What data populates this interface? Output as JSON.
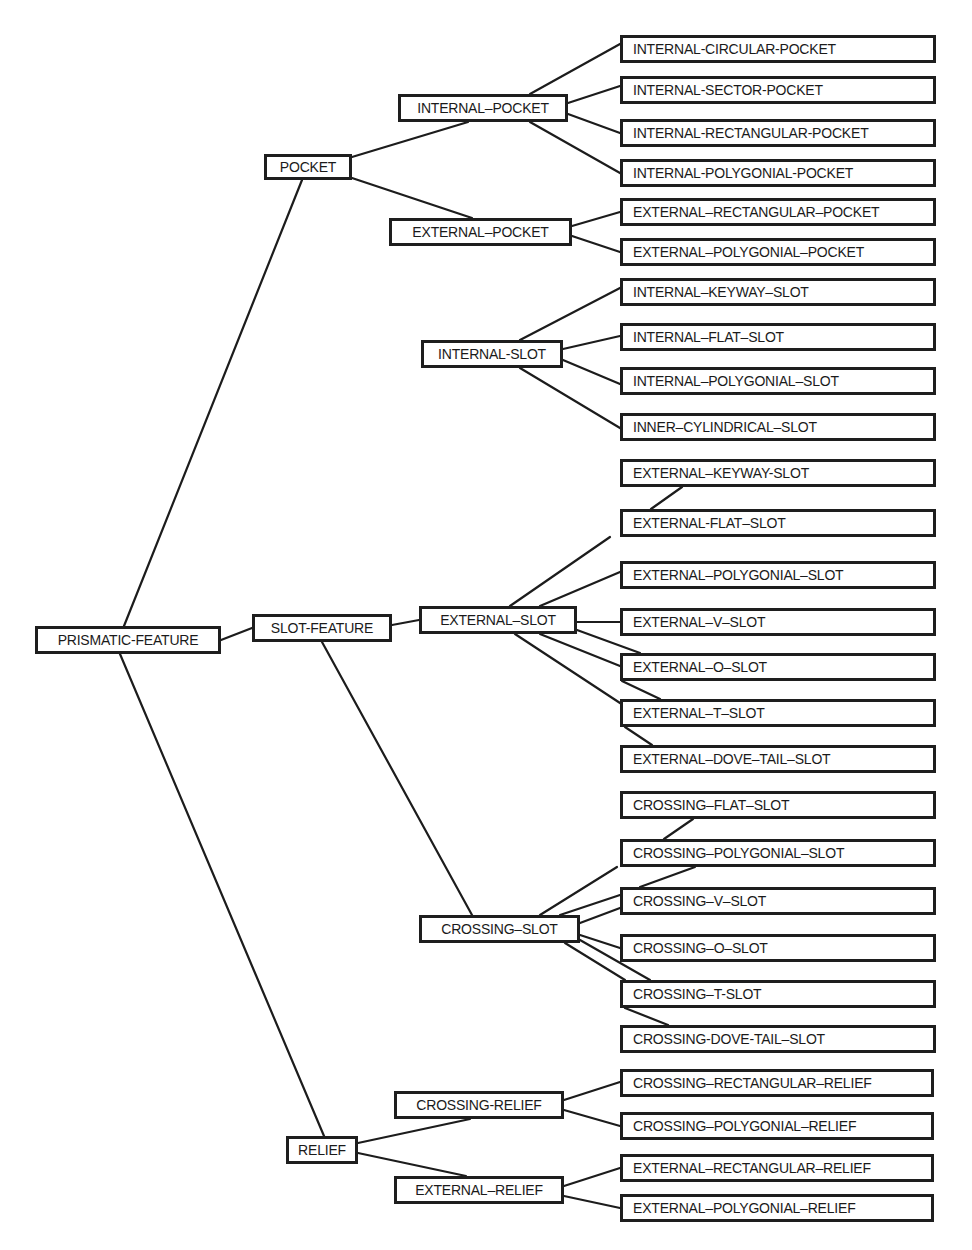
{
  "diagram": {
    "type": "tree",
    "root": "PRISMATIC-FEATURE",
    "nodes": [
      {
        "id": "prismatic-feature",
        "label": "PRISMATIC-FEATURE",
        "x": 35,
        "y": 626,
        "w": 186,
        "h": 28,
        "center": true
      },
      {
        "id": "pocket",
        "label": "POCKET",
        "x": 264,
        "y": 154,
        "w": 88,
        "h": 26,
        "center": true
      },
      {
        "id": "slot-feature",
        "label": "SLOT-FEATURE",
        "x": 252,
        "y": 614,
        "w": 140,
        "h": 28,
        "center": true
      },
      {
        "id": "relief",
        "label": "RELIEF",
        "x": 286,
        "y": 1136,
        "w": 72,
        "h": 28,
        "center": true
      },
      {
        "id": "internal-pocket",
        "label": "INTERNAL–POCKET",
        "x": 398,
        "y": 94,
        "w": 170,
        "h": 28,
        "center": true
      },
      {
        "id": "external-pocket",
        "label": "EXTERNAL–POCKET",
        "x": 389,
        "y": 218,
        "w": 183,
        "h": 28,
        "center": true
      },
      {
        "id": "internal-slot",
        "label": "INTERNAL-SLOT",
        "x": 421,
        "y": 340,
        "w": 142,
        "h": 28,
        "center": true
      },
      {
        "id": "external-slot",
        "label": "EXTERNAL–SLOT",
        "x": 419,
        "y": 606,
        "w": 158,
        "h": 28,
        "center": true
      },
      {
        "id": "crossing-slot",
        "label": "CROSSING–SLOT",
        "x": 419,
        "y": 915,
        "w": 161,
        "h": 28,
        "center": true
      },
      {
        "id": "crossing-relief",
        "label": "CROSSING-RELIEF",
        "x": 394,
        "y": 1091,
        "w": 170,
        "h": 28,
        "center": true
      },
      {
        "id": "external-relief",
        "label": "EXTERNAL–RELIEF",
        "x": 394,
        "y": 1176,
        "w": 170,
        "h": 28,
        "center": true
      },
      {
        "id": "internal-circular-pocket",
        "label": "INTERNAL-CIRCULAR-POCKET",
        "x": 620,
        "y": 35,
        "w": 316,
        "h": 28
      },
      {
        "id": "internal-sector-pocket",
        "label": "INTERNAL-SECTOR-POCKET",
        "x": 620,
        "y": 76,
        "w": 316,
        "h": 28
      },
      {
        "id": "internal-rectangular-pocket",
        "label": "INTERNAL-RECTANGULAR-POCKET",
        "x": 620,
        "y": 119,
        "w": 316,
        "h": 28
      },
      {
        "id": "internal-polygonial-pocket",
        "label": "INTERNAL-POLYGONIAL-POCKET",
        "x": 620,
        "y": 159,
        "w": 316,
        "h": 28
      },
      {
        "id": "external-rectangular-pocket",
        "label": "EXTERNAL–RECTANGULAR–POCKET",
        "x": 620,
        "y": 198,
        "w": 316,
        "h": 28
      },
      {
        "id": "external-polygonial-pocket",
        "label": "EXTERNAL–POLYGONIAL–POCKET",
        "x": 620,
        "y": 238,
        "w": 316,
        "h": 28
      },
      {
        "id": "internal-keyway-slot",
        "label": "INTERNAL–KEYWAY–SLOT",
        "x": 620,
        "y": 278,
        "w": 316,
        "h": 28
      },
      {
        "id": "internal-flat-slot",
        "label": "INTERNAL–FLAT–SLOT",
        "x": 620,
        "y": 323,
        "w": 316,
        "h": 28
      },
      {
        "id": "internal-polygonial-slot",
        "label": "INTERNAL–POLYGONIAL–SLOT",
        "x": 620,
        "y": 367,
        "w": 316,
        "h": 28
      },
      {
        "id": "inner-cylindrical-slot",
        "label": "INNER–CYLINDRICAL–SLOT",
        "x": 620,
        "y": 413,
        "w": 316,
        "h": 28
      },
      {
        "id": "external-keyway-slot",
        "label": "EXTERNAL–KEYWAY-SLOT",
        "x": 620,
        "y": 459,
        "w": 316,
        "h": 28
      },
      {
        "id": "external-flat-slot",
        "label": "EXTERNAL-FLAT–SLOT",
        "x": 620,
        "y": 509,
        "w": 316,
        "h": 28
      },
      {
        "id": "external-polygonial-slot",
        "label": "EXTERNAL–POLYGONIAL–SLOT",
        "x": 620,
        "y": 561,
        "w": 316,
        "h": 28
      },
      {
        "id": "external-v-slot",
        "label": "EXTERNAL–V–SLOT",
        "x": 620,
        "y": 608,
        "w": 316,
        "h": 28
      },
      {
        "id": "external-o-slot",
        "label": "EXTERNAL–O–SLOT",
        "x": 620,
        "y": 653,
        "w": 316,
        "h": 28
      },
      {
        "id": "external-t-slot",
        "label": "EXTERNAL–T–SLOT",
        "x": 620,
        "y": 699,
        "w": 316,
        "h": 28
      },
      {
        "id": "external-dove-tail-slot",
        "label": "EXTERNAL–DOVE–TAIL–SLOT",
        "x": 620,
        "y": 745,
        "w": 316,
        "h": 28
      },
      {
        "id": "crossing-flat-slot",
        "label": "CROSSING–FLAT–SLOT",
        "x": 620,
        "y": 791,
        "w": 316,
        "h": 28
      },
      {
        "id": "crossing-polygonial-slot",
        "label": "CROSSING–POLYGONIAL–SLOT",
        "x": 620,
        "y": 839,
        "w": 316,
        "h": 28
      },
      {
        "id": "crossing-v-slot",
        "label": "CROSSING–V–SLOT",
        "x": 620,
        "y": 887,
        "w": 316,
        "h": 28
      },
      {
        "id": "crossing-o-slot",
        "label": "CROSSING–O–SLOT",
        "x": 620,
        "y": 934,
        "w": 316,
        "h": 28
      },
      {
        "id": "crossing-t-slot",
        "label": "CROSSING–T-SLOT",
        "x": 620,
        "y": 980,
        "w": 316,
        "h": 28
      },
      {
        "id": "crossing-dove-tail-slot",
        "label": "CROSSING-DOVE-TAIL–SLOT",
        "x": 620,
        "y": 1025,
        "w": 316,
        "h": 28
      },
      {
        "id": "crossing-rectangular-relief",
        "label": "CROSSING–RECTANGULAR–RELIEF",
        "x": 620,
        "y": 1069,
        "w": 314,
        "h": 28
      },
      {
        "id": "crossing-polygonial-relief",
        "label": "CROSSING–POLYGONIAL–RELIEF",
        "x": 620,
        "y": 1112,
        "w": 314,
        "h": 28
      },
      {
        "id": "external-rectangular-relief",
        "label": "EXTERNAL–RECTANGULAR–RELIEF",
        "x": 620,
        "y": 1154,
        "w": 314,
        "h": 28
      },
      {
        "id": "external-polygonial-relief",
        "label": "EXTERNAL–POLYGONIAL–RELIEF",
        "x": 620,
        "y": 1194,
        "w": 314,
        "h": 28
      }
    ],
    "edges": [
      {
        "from": "prismatic-feature",
        "to": "pocket",
        "x1": 124,
        "y1": 626,
        "x2": 302,
        "y2": 180
      },
      {
        "from": "prismatic-feature",
        "to": "slot-feature",
        "x1": 221,
        "y1": 640,
        "x2": 252,
        "y2": 628
      },
      {
        "from": "prismatic-feature",
        "to": "relief",
        "x1": 120,
        "y1": 654,
        "x2": 324,
        "y2": 1136
      },
      {
        "from": "pocket",
        "to": "internal-pocket",
        "x1": 352,
        "y1": 157,
        "x2": 468,
        "y2": 122
      },
      {
        "from": "pocket",
        "to": "external-pocket",
        "x1": 352,
        "y1": 178,
        "x2": 472,
        "y2": 218
      },
      {
        "from": "internal-pocket",
        "to": "internal-circular-pocket",
        "x1": 530,
        "y1": 94,
        "x2": 620,
        "y2": 44
      },
      {
        "from": "internal-pocket",
        "to": "internal-sector-pocket",
        "x1": 568,
        "y1": 103,
        "x2": 620,
        "y2": 86
      },
      {
        "from": "internal-pocket",
        "to": "internal-rectangular-pocket",
        "x1": 568,
        "y1": 114,
        "x2": 620,
        "y2": 133
      },
      {
        "from": "internal-pocket",
        "to": "internal-polygonial-pocket",
        "x1": 530,
        "y1": 122,
        "x2": 620,
        "y2": 173
      },
      {
        "from": "external-pocket",
        "to": "external-rectangular-pocket",
        "x1": 572,
        "y1": 226,
        "x2": 620,
        "y2": 212
      },
      {
        "from": "external-pocket",
        "to": "external-polygonial-pocket",
        "x1": 572,
        "y1": 236,
        "x2": 620,
        "y2": 252
      },
      {
        "from": "internal-slot",
        "to": "internal-keyway-slot",
        "x1": 520,
        "y1": 340,
        "x2": 620,
        "y2": 288
      },
      {
        "from": "internal-slot",
        "to": "internal-flat-slot",
        "x1": 563,
        "y1": 349,
        "x2": 620,
        "y2": 336
      },
      {
        "from": "internal-slot",
        "to": "internal-polygonial-slot",
        "x1": 563,
        "y1": 360,
        "x2": 620,
        "y2": 384
      },
      {
        "from": "internal-slot",
        "to": "inner-cylindrical-slot",
        "x1": 520,
        "y1": 368,
        "x2": 620,
        "y2": 428
      },
      {
        "from": "slot-feature",
        "to": "external-slot",
        "x1": 392,
        "y1": 625,
        "x2": 419,
        "y2": 620
      },
      {
        "from": "slot-feature",
        "to": "crossing-slot",
        "x1": 322,
        "y1": 642,
        "x2": 472,
        "y2": 915
      },
      {
        "from": "external-slot",
        "to": "external-keyway-slot",
        "x1": 682,
        "y1": 487,
        "x2": 651,
        "y2": 509
      },
      {
        "from": "external-slot",
        "to": "external-flat-slot",
        "x1": 510,
        "y1": 606,
        "x2": 610,
        "y2": 537
      },
      {
        "from": "external-slot",
        "to": "external-polygonial-slot",
        "x1": 540,
        "y1": 606,
        "x2": 620,
        "y2": 572
      },
      {
        "from": "external-slot",
        "to": "external-v-slot",
        "x1": 577,
        "y1": 622,
        "x2": 620,
        "y2": 622
      },
      {
        "from": "external-slot",
        "to": "external-o-slot",
        "x1": 577,
        "y1": 630,
        "x2": 640,
        "y2": 653
      },
      {
        "from": "external-slot",
        "to": "external-o-slot-2",
        "x1": 540,
        "y1": 634,
        "x2": 620,
        "y2": 666
      },
      {
        "from": "external-slot",
        "to": "external-t-slot",
        "x1": 515,
        "y1": 634,
        "x2": 620,
        "y2": 703
      },
      {
        "from": "external-o-slot",
        "to": "external-t-slot",
        "x1": 622,
        "y1": 681,
        "x2": 660,
        "y2": 699
      },
      {
        "from": "external-t-slot",
        "to": "external-dove-tail-slot",
        "x1": 625,
        "y1": 727,
        "x2": 652,
        "y2": 745
      },
      {
        "from": "crossing-slot",
        "to": "crossing-flat-slot",
        "x1": 693,
        "y1": 819,
        "x2": 664,
        "y2": 839
      },
      {
        "from": "crossing-slot",
        "to": "crossing-polygonial-slot",
        "x1": 540,
        "y1": 915,
        "x2": 617,
        "y2": 867
      },
      {
        "from": "crossing-slot",
        "to": "crossing-v-slot-a",
        "x1": 695,
        "y1": 867,
        "x2": 640,
        "y2": 887
      },
      {
        "from": "crossing-slot",
        "to": "crossing-v-slot",
        "x1": 560,
        "y1": 915,
        "x2": 620,
        "y2": 895
      },
      {
        "from": "crossing-slot",
        "to": "crossing-v-slot-b",
        "x1": 580,
        "y1": 923,
        "x2": 620,
        "y2": 908
      },
      {
        "from": "crossing-slot",
        "to": "crossing-o-slot",
        "x1": 580,
        "y1": 935,
        "x2": 620,
        "y2": 948
      },
      {
        "from": "crossing-slot",
        "to": "crossing-t-slot",
        "x1": 565,
        "y1": 943,
        "x2": 625,
        "y2": 980
      },
      {
        "from": "crossing-slot",
        "to": "crossing-t-slot-b",
        "x1": 580,
        "y1": 940,
        "x2": 650,
        "y2": 980
      },
      {
        "from": "crossing-t-slot",
        "to": "crossing-dove-tail-slot",
        "x1": 625,
        "y1": 1008,
        "x2": 668,
        "y2": 1025
      },
      {
        "from": "relief",
        "to": "crossing-relief",
        "x1": 358,
        "y1": 1143,
        "x2": 470,
        "y2": 1119
      },
      {
        "from": "relief",
        "to": "external-relief",
        "x1": 358,
        "y1": 1153,
        "x2": 466,
        "y2": 1176
      },
      {
        "from": "crossing-relief",
        "to": "crossing-rectangular-relief",
        "x1": 564,
        "y1": 1100,
        "x2": 620,
        "y2": 1082
      },
      {
        "from": "crossing-relief",
        "to": "crossing-polygonial-relief",
        "x1": 564,
        "y1": 1110,
        "x2": 620,
        "y2": 1126
      },
      {
        "from": "external-relief",
        "to": "external-rectangular-relief",
        "x1": 564,
        "y1": 1186,
        "x2": 620,
        "y2": 1168
      },
      {
        "from": "external-relief",
        "to": "external-polygonial-relief",
        "x1": 564,
        "y1": 1196,
        "x2": 620,
        "y2": 1208
      }
    ]
  }
}
